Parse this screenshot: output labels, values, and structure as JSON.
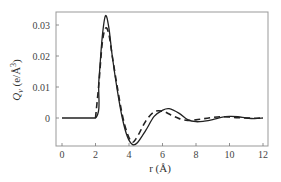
{
  "chart_data": {
    "type": "line",
    "title": "",
    "xlabel": "r (Å)",
    "ylabel": "Q_v (e/Å^3)",
    "xlim": [
      -0.5,
      12.3
    ],
    "ylim": [
      -0.009,
      0.035
    ],
    "xticks": [
      "0",
      "2",
      "4",
      "6",
      "8",
      "10",
      "12"
    ],
    "yticks": [
      "0",
      "0.01",
      "0.02",
      "0.03"
    ],
    "grid": false,
    "legend": null,
    "series": [
      {
        "name": "solid",
        "style": "solid",
        "x": [
          0,
          2.0,
          2.2,
          2.4,
          2.6,
          2.8,
          3.0,
          3.3,
          3.6,
          3.9,
          4.2,
          4.5,
          5.0,
          5.5,
          6.0,
          6.4,
          7.0,
          7.5,
          8.0,
          8.5,
          9.0,
          9.5,
          10.0,
          10.5,
          11.0,
          11.5,
          12.0
        ],
        "y": [
          0,
          0,
          0.012,
          0.026,
          0.033,
          0.029,
          0.02,
          0.009,
          0.0,
          -0.006,
          -0.0085,
          -0.008,
          -0.004,
          0.0005,
          0.0025,
          0.003,
          0.0015,
          -0.0005,
          -0.0012,
          -0.001,
          -0.0005,
          0.0002,
          0.0005,
          0.0004,
          0.0,
          -0.0002,
          0.0
        ]
      },
      {
        "name": "dashed",
        "style": "dashed",
        "x": [
          2.0,
          2.2,
          2.4,
          2.6,
          2.8,
          3.0,
          3.3,
          3.6,
          3.9,
          4.2,
          4.5,
          5.0,
          5.5,
          6.0,
          6.5,
          7.0,
          7.5,
          8.0,
          8.5,
          9.0,
          9.5,
          10.0,
          10.5,
          11.0,
          11.5,
          12.0
        ],
        "y": [
          0,
          0.011,
          0.024,
          0.029,
          0.027,
          0.02,
          0.01,
          0.001,
          -0.005,
          -0.0078,
          -0.006,
          -0.001,
          0.002,
          0.0022,
          0.001,
          -0.0002,
          -0.0008,
          -0.0006,
          -0.0002,
          0.0002,
          0.0004,
          0.0003,
          0.0001,
          0.0,
          -0.0001,
          0.0
        ]
      }
    ]
  }
}
